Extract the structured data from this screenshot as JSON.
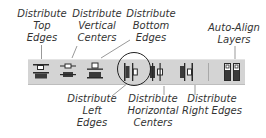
{
  "labels": {
    "distribute_top_edges": [
      "Distribute",
      "Top",
      "Edges"
    ],
    "distribute_vertical_centers": [
      "Distribute",
      "Vertical",
      "Centers"
    ],
    "distribute_bottom_edges": [
      "Distribute",
      "Bottom",
      "Edges"
    ],
    "auto_align_layers": [
      "Auto-Align",
      "Layers"
    ],
    "distribute_left_edges": [
      "Distribute",
      "Left",
      "Edges"
    ],
    "distribute_horizontal_centers": [
      "Distribute",
      "Horizontal",
      "Centers"
    ],
    "distribute_right_edges": [
      "Distribute",
      "Right Edges"
    ]
  },
  "toolbar": {
    "buttons": [
      {
        "id": "distribute-top-edges",
        "icon": "distribute-top-edges-icon"
      },
      {
        "id": "distribute-vertical-centers",
        "icon": "distribute-vertical-centers-icon"
      },
      {
        "id": "distribute-bottom-edges",
        "icon": "distribute-bottom-edges-icon"
      },
      {
        "id": "distribute-left-edges",
        "icon": "distribute-left-edges-icon"
      },
      {
        "id": "distribute-horizontal-centers",
        "icon": "distribute-horizontal-centers-icon",
        "highlighted": true
      },
      {
        "id": "distribute-right-edges",
        "icon": "distribute-right-edges-icon"
      },
      {
        "id": "auto-align-layers",
        "icon": "auto-align-layers-icon"
      }
    ]
  },
  "colors": {
    "toolbar_bg": "#d4d4d4",
    "icon_dark": "#3a3a3a",
    "icon_outline": "#2a2a2a",
    "callout_line": "#999999",
    "highlight_circle": "#222222"
  }
}
